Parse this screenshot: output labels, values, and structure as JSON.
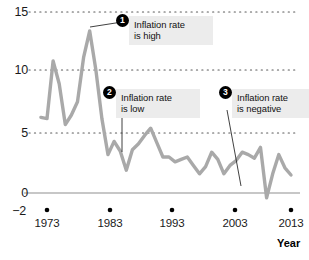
{
  "chart_data": {
    "type": "line",
    "title": "",
    "subtitle": "",
    "xlabel": "Year",
    "ylabel": "",
    "xlim": [
      1972,
      2014
    ],
    "ylim": [
      -2,
      15
    ],
    "grid": true,
    "gridlines_y": [
      5,
      10,
      15
    ],
    "zero_line": 0,
    "legend": "none",
    "ytick_labels": [
      "15",
      "10",
      "5",
      "0",
      "−2"
    ],
    "ytick_values": [
      15,
      10,
      5,
      0,
      -2
    ],
    "xtick_labels": [
      "1973",
      "1983",
      "1993",
      "2003",
      "2013"
    ],
    "xtick_values": [
      1973,
      1983,
      1993,
      2003,
      2013
    ],
    "series": [
      {
        "name": "Inflation rate",
        "color": "#a9a9a9",
        "x": [
          1972,
          1973,
          1974,
          1975,
          1976,
          1977,
          1978,
          1979,
          1980,
          1981,
          1982,
          1983,
          1984,
          1985,
          1986,
          1987,
          1988,
          1989,
          1990,
          1991,
          1992,
          1993,
          1994,
          1995,
          1996,
          1997,
          1998,
          1999,
          2000,
          2001,
          2002,
          2003,
          2004,
          2005,
          2006,
          2007,
          2008,
          2009,
          2010,
          2011,
          2012,
          2013
        ],
        "values": [
          6.3,
          6.2,
          11.0,
          9.1,
          5.7,
          6.5,
          7.6,
          11.3,
          13.5,
          10.3,
          6.2,
          3.2,
          4.3,
          3.5,
          1.9,
          3.6,
          4.1,
          4.8,
          5.4,
          4.2,
          3.0,
          3.0,
          2.6,
          2.8,
          3.0,
          2.3,
          1.6,
          2.2,
          3.4,
          2.8,
          1.6,
          2.3,
          2.7,
          3.4,
          3.2,
          2.9,
          3.8,
          -0.4,
          1.6,
          3.2,
          2.1,
          1.5
        ]
      }
    ],
    "annotations": [
      {
        "id": "1",
        "number": "1",
        "text": "Inflation rate\nis high",
        "target_x": 1980,
        "target_y": 13.5
      },
      {
        "id": "2",
        "number": "2",
        "text": "Inflation rate\nis low",
        "target_x": 1986,
        "target_y": 1.9
      },
      {
        "id": "3",
        "number": "3",
        "text": "Inflation rate\nis negative",
        "target_x": 2009,
        "target_y": -0.4
      }
    ]
  }
}
